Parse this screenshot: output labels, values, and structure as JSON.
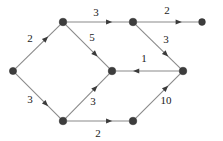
{
  "figure": {
    "type": "directed-weighted-graph",
    "background_color": "#ffffff",
    "node_color": "#3d3d3d",
    "edge_color": "#8a8a8a",
    "arrow_color": "#3a3a3a",
    "label_color": "#1a1a1a",
    "width": 223,
    "height": 141
  },
  "nodes": [
    {
      "id": "n_left",
      "name": "left-node",
      "x": 13,
      "y": 71,
      "r": 3.6
    },
    {
      "id": "n_top_left",
      "name": "top-left-node",
      "x": 63,
      "y": 22,
      "r": 3.8
    },
    {
      "id": "n_bottom_left",
      "name": "bottom-left-node",
      "x": 63,
      "y": 121,
      "r": 3.8
    },
    {
      "id": "n_center",
      "name": "center-node",
      "x": 112,
      "y": 71,
      "r": 3.8
    },
    {
      "id": "n_top_mid",
      "name": "top-middle-node",
      "x": 133,
      "y": 22,
      "r": 3.8
    },
    {
      "id": "n_bottom_mid",
      "name": "bottom-middle-node",
      "x": 133,
      "y": 121,
      "r": 3.8
    },
    {
      "id": "n_right",
      "name": "right-node",
      "x": 183,
      "y": 71,
      "r": 3.8
    },
    {
      "id": "n_top_right",
      "name": "top-right-node",
      "x": 202,
      "y": 22,
      "r": 3.4
    }
  ],
  "edges": [
    {
      "id": "e1",
      "name": "edge-left-to-top-left",
      "from": "n_left",
      "to": "n_top_left",
      "weight": "2",
      "label_x": 30,
      "label_y": 38
    },
    {
      "id": "e2",
      "name": "edge-left-to-bottom-left",
      "from": "n_left",
      "to": "n_bottom_left",
      "weight": "3",
      "label_x": 30,
      "label_y": 99
    },
    {
      "id": "e3",
      "name": "edge-top-left-to-top-middle",
      "from": "n_top_left",
      "to": "n_top_mid",
      "weight": "3",
      "label_x": 96,
      "label_y": 12
    },
    {
      "id": "e4",
      "name": "edge-top-left-to-center",
      "from": "n_top_left",
      "to": "n_center",
      "weight": "5",
      "label_x": 92,
      "label_y": 37
    },
    {
      "id": "e5",
      "name": "edge-bottom-left-to-center",
      "from": "n_bottom_left",
      "to": "n_center",
      "weight": "3",
      "label_x": 93,
      "label_y": 101
    },
    {
      "id": "e6",
      "name": "edge-bottom-left-to-bottom-mid",
      "from": "n_bottom_left",
      "to": "n_bottom_mid",
      "weight": "2",
      "label_x": 98,
      "label_y": 133
    },
    {
      "id": "e7",
      "name": "edge-top-middle-to-top-right",
      "from": "n_top_mid",
      "to": "n_top_right",
      "weight": "2",
      "label_x": 167,
      "label_y": 10
    },
    {
      "id": "e8",
      "name": "edge-top-middle-to-right",
      "from": "n_top_mid",
      "to": "n_right",
      "weight": "3",
      "label_x": 166,
      "label_y": 39
    },
    {
      "id": "e9",
      "name": "edge-right-to-center",
      "from": "n_right",
      "to": "n_center",
      "weight": "1",
      "label_x": 144,
      "label_y": 58
    },
    {
      "id": "e10",
      "name": "edge-bottom-middle-to-right",
      "from": "n_bottom_mid",
      "to": "n_right",
      "weight": "10",
      "label_x": 166,
      "label_y": 100
    }
  ]
}
